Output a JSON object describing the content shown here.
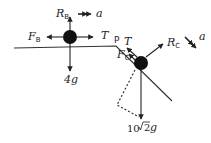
{
  "diagram": {
    "colors": {
      "ink": "#222222",
      "particle": "#111111",
      "background": "#ffffff"
    },
    "particle_B": {
      "forces": {
        "normal": {
          "symbol": "R",
          "sub": "B"
        },
        "friction": {
          "symbol": "F",
          "sub": "B"
        },
        "tension": {
          "symbol": "T"
        },
        "weight": {
          "label": "4g"
        }
      },
      "acceleration": {
        "symbol": "a"
      }
    },
    "edge_label": "P",
    "particle_C": {
      "forces": {
        "normal": {
          "symbol": "R",
          "sub": "C"
        },
        "friction": {
          "symbol": "F",
          "sub": "C"
        },
        "tension": {
          "symbol": "T"
        },
        "weight": {
          "prefix": "10",
          "root": "2",
          "suffix": "g"
        }
      },
      "acceleration": {
        "symbol": "a"
      }
    }
  }
}
